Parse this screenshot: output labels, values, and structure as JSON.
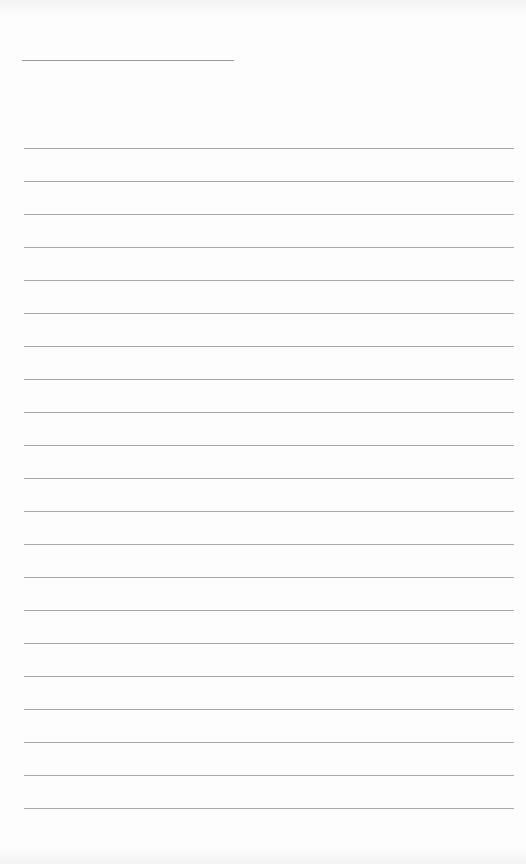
{
  "page": {
    "type": "lined-paper",
    "title_line": {
      "x": 22,
      "y": 60,
      "width": 212
    },
    "rules": {
      "count": 21,
      "first_y": 148,
      "spacing": 33,
      "x": 24,
      "width": 490
    },
    "colors": {
      "paper": "#fdfdfd",
      "rule": "#a8a8a8"
    }
  }
}
